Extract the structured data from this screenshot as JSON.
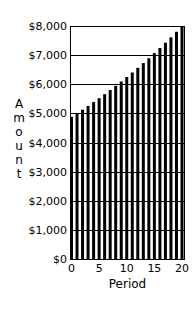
{
  "chart_data": {
    "type": "bar",
    "title": "",
    "xlabel": "Period",
    "ylabel": "Amount",
    "x": [
      0,
      1,
      2,
      3,
      4,
      5,
      6,
      7,
      8,
      9,
      10,
      11,
      12,
      13,
      14,
      15,
      16,
      17,
      18,
      19,
      20
    ],
    "values": [
      4880,
      5002,
      5127,
      5255,
      5387,
      5521,
      5659,
      5801,
      5946,
      6094,
      6247,
      6403,
      6563,
      6727,
      6895,
      7068,
      7245,
      7426,
      7611,
      7802,
      7996
    ],
    "ylim": [
      0,
      8000
    ],
    "xlim": [
      0,
      20
    ],
    "yticks": [
      0,
      1000,
      2000,
      3000,
      4000,
      5000,
      6000,
      7000,
      8000
    ],
    "ytick_labels": [
      "$0",
      "$1,000",
      "$2,000",
      "$3,000",
      "$4,000",
      "$5,000",
      "$6,000",
      "$7,000",
      "$8,000"
    ],
    "xticks": [
      0,
      5,
      10,
      15,
      20
    ],
    "xtick_labels": [
      "0",
      "5",
      "10",
      "15",
      "20"
    ],
    "grid": "horizontal",
    "legend": "none",
    "bar_color": "#000000",
    "grid_color": "#000000"
  }
}
